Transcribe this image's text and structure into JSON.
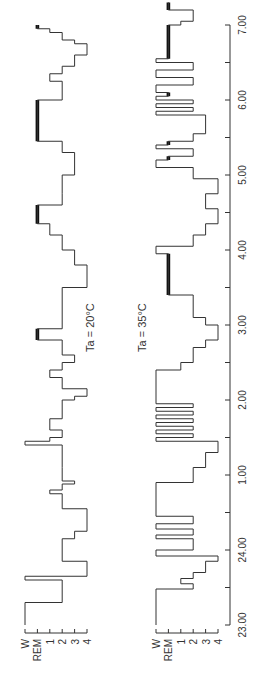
{
  "chart_data": {
    "type": "line",
    "subtype": "hypnogram",
    "orientation": "rotated-90-ccw",
    "xlabel": "Clock time",
    "x_ticks": [
      "23.00",
      "24.00",
      "1.00",
      "2.00",
      "3.00",
      "4.00",
      "5.00",
      "6.00",
      "7.00"
    ],
    "x_range": [
      23,
      31
    ],
    "y_ticks": [
      "W",
      "REM",
      "1",
      "2",
      "3",
      "4"
    ],
    "series": [
      {
        "name": "Ta = 20°C",
        "label": "Ta = 20°C",
        "segments": [
          [
            23.0,
            23.3,
            "W"
          ],
          [
            23.3,
            23.6,
            "2"
          ],
          [
            23.6,
            23.65,
            "W"
          ],
          [
            23.65,
            23.85,
            "4"
          ],
          [
            23.85,
            24.15,
            "2"
          ],
          [
            24.15,
            24.25,
            "3"
          ],
          [
            24.25,
            24.55,
            "4"
          ],
          [
            24.55,
            24.75,
            "2"
          ],
          [
            24.75,
            24.8,
            "1"
          ],
          [
            24.8,
            24.88,
            "2"
          ],
          [
            24.88,
            24.92,
            "3"
          ],
          [
            24.92,
            25.1,
            "2"
          ],
          [
            25.1,
            25.4,
            "2"
          ],
          [
            25.4,
            25.45,
            "W"
          ],
          [
            25.45,
            25.5,
            "1"
          ],
          [
            25.5,
            25.6,
            "2"
          ],
          [
            25.6,
            25.75,
            "1"
          ],
          [
            25.75,
            26.0,
            "2"
          ],
          [
            26.0,
            26.05,
            "3"
          ],
          [
            26.05,
            26.15,
            "4"
          ],
          [
            26.15,
            26.3,
            "2"
          ],
          [
            26.3,
            26.4,
            "1"
          ],
          [
            26.4,
            26.5,
            "2"
          ],
          [
            26.5,
            26.6,
            "3"
          ],
          [
            26.6,
            26.8,
            "2"
          ],
          [
            26.8,
            26.95,
            "REM"
          ],
          [
            26.95,
            27.5,
            "2"
          ],
          [
            27.5,
            27.6,
            "4"
          ],
          [
            27.6,
            27.8,
            "4"
          ],
          [
            27.8,
            28.0,
            "3"
          ],
          [
            28.0,
            28.2,
            "2"
          ],
          [
            28.2,
            28.35,
            "1"
          ],
          [
            28.35,
            28.6,
            "REM"
          ],
          [
            28.6,
            28.75,
            "2"
          ],
          [
            28.75,
            29.0,
            "2"
          ],
          [
            29.0,
            29.3,
            "3"
          ],
          [
            29.3,
            29.45,
            "2"
          ],
          [
            29.45,
            30.0,
            "REM"
          ],
          [
            30.0,
            30.25,
            "2"
          ],
          [
            30.25,
            30.35,
            "1"
          ],
          [
            30.35,
            30.45,
            "2"
          ],
          [
            30.45,
            30.6,
            "3"
          ],
          [
            30.6,
            30.75,
            "4"
          ],
          [
            30.75,
            30.8,
            "3"
          ],
          [
            30.8,
            30.9,
            "2"
          ],
          [
            30.9,
            30.95,
            "1"
          ],
          [
            30.95,
            31.0,
            "REM"
          ]
        ]
      },
      {
        "name": "Ta = 35°C",
        "label": "Ta = 35°C",
        "segments": [
          [
            23.0,
            23.48,
            "W"
          ],
          [
            23.48,
            23.55,
            "2"
          ],
          [
            23.55,
            23.62,
            "1"
          ],
          [
            23.62,
            23.7,
            "2"
          ],
          [
            23.7,
            23.85,
            "3"
          ],
          [
            23.85,
            23.92,
            "4"
          ],
          [
            23.92,
            24.0,
            "W"
          ],
          [
            24.0,
            24.15,
            "2"
          ],
          [
            24.15,
            24.2,
            "W"
          ],
          [
            24.2,
            24.28,
            "2"
          ],
          [
            24.28,
            24.35,
            "W"
          ],
          [
            24.35,
            24.45,
            "2"
          ],
          [
            24.45,
            24.9,
            "W"
          ],
          [
            24.9,
            25.1,
            "2"
          ],
          [
            25.1,
            25.3,
            "3"
          ],
          [
            25.3,
            25.45,
            "4"
          ],
          [
            25.45,
            25.5,
            "W"
          ],
          [
            25.5,
            25.55,
            "2"
          ],
          [
            25.55,
            25.6,
            "W"
          ],
          [
            25.6,
            25.65,
            "2"
          ],
          [
            25.65,
            25.7,
            "W"
          ],
          [
            25.7,
            25.75,
            "2"
          ],
          [
            25.75,
            25.8,
            "W"
          ],
          [
            25.8,
            25.85,
            "2"
          ],
          [
            25.85,
            25.9,
            "W"
          ],
          [
            25.9,
            25.95,
            "2"
          ],
          [
            25.95,
            26.4,
            "W"
          ],
          [
            26.4,
            26.5,
            "1"
          ],
          [
            26.5,
            26.7,
            "2"
          ],
          [
            26.7,
            26.8,
            "3"
          ],
          [
            26.8,
            27.0,
            "4"
          ],
          [
            27.0,
            27.1,
            "3"
          ],
          [
            27.1,
            27.4,
            "2"
          ],
          [
            27.4,
            27.95,
            "REM"
          ],
          [
            27.95,
            28.05,
            "W"
          ],
          [
            28.05,
            28.2,
            "2"
          ],
          [
            28.2,
            28.35,
            "3"
          ],
          [
            28.35,
            28.55,
            "4"
          ],
          [
            28.55,
            28.75,
            "3"
          ],
          [
            28.75,
            28.95,
            "4"
          ],
          [
            28.95,
            29.1,
            "2"
          ],
          [
            29.1,
            29.2,
            "W"
          ],
          [
            29.2,
            29.25,
            "REM"
          ],
          [
            29.25,
            29.35,
            "2"
          ],
          [
            29.35,
            29.4,
            "W"
          ],
          [
            29.4,
            29.45,
            "REM"
          ],
          [
            29.45,
            29.55,
            "2"
          ],
          [
            29.55,
            29.8,
            "3"
          ],
          [
            29.8,
            29.85,
            "W"
          ],
          [
            29.85,
            29.9,
            "2"
          ],
          [
            29.9,
            29.95,
            "W"
          ],
          [
            29.95,
            30.0,
            "2"
          ],
          [
            30.0,
            30.05,
            "W"
          ],
          [
            30.05,
            30.1,
            "REM"
          ],
          [
            30.1,
            30.2,
            "W"
          ],
          [
            30.2,
            30.3,
            "2"
          ],
          [
            30.3,
            30.4,
            "W"
          ],
          [
            30.4,
            30.5,
            "2"
          ],
          [
            30.5,
            30.55,
            "W"
          ],
          [
            30.55,
            31.0,
            "REM"
          ],
          [
            31.0,
            31.05,
            "1"
          ],
          [
            31.05,
            31.2,
            "2"
          ],
          [
            31.2,
            31.3,
            "REM"
          ]
        ]
      }
    ],
    "legend": "none",
    "grid": false
  },
  "panels": [
    {
      "label": "Ta = 20°C"
    },
    {
      "label": "Ta = 35°C"
    }
  ],
  "axis": {
    "stage_labels": [
      "W",
      "REM",
      "1",
      "2",
      "3",
      "4"
    ],
    "time_labels": [
      "23.00",
      "24.00",
      "1.00",
      "2.00",
      "3.00",
      "4.00",
      "5.00",
      "6.00",
      "7.00"
    ]
  },
  "colors": {
    "line": "#333333",
    "rem": "#111111",
    "axis": "#333333"
  }
}
